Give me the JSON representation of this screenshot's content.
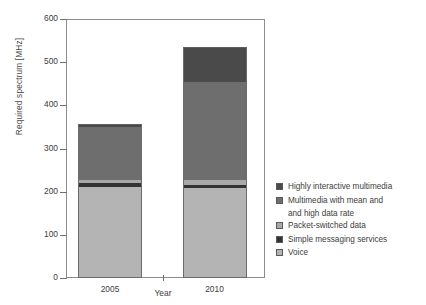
{
  "chart_data": {
    "type": "bar",
    "subtype": "stacked-bar",
    "title": "",
    "xlabel": "Year",
    "ylabel": "Required spectrum [MHz]",
    "categories": [
      "2005",
      "2010"
    ],
    "ylim": [
      0,
      600
    ],
    "yticks": [
      0,
      100,
      200,
      300,
      400,
      500,
      600
    ],
    "ytick_labels": [
      "0",
      "100",
      "200",
      "300",
      "400",
      "500",
      "600"
    ],
    "grid": false,
    "legend_position": "right",
    "series": [
      {
        "name": "Voice",
        "color": "#b4b4b4",
        "values": [
          211,
          208
        ]
      },
      {
        "name": "Simple messaging services",
        "color": "#333333",
        "values": [
          8,
          8
        ]
      },
      {
        "name": "Packet-switched data",
        "color": "#a8a8a8",
        "values": [
          9,
          10
        ]
      },
      {
        "name": "Multimedia with mean and and high data rate",
        "color": "#6e6e6e",
        "values": [
          121,
          229
        ]
      },
      {
        "name": "Highly interactive multimedia",
        "color": "#4a4a4a",
        "values": [
          8,
          80
        ]
      }
    ],
    "totals": [
      357,
      535
    ],
    "annotations": []
  },
  "legend": {
    "items": [
      {
        "label": "Highly interactive multimedia",
        "label_cont": "",
        "color": "#4a4a4a"
      },
      {
        "label": "Multimedia with mean and",
        "label_cont": "and high data rate",
        "color": "#6e6e6e"
      },
      {
        "label": "Packet-switched data",
        "label_cont": "",
        "color": "#a8a8a8"
      },
      {
        "label": "Simple messaging services",
        "label_cont": "",
        "color": "#333333"
      },
      {
        "label": "Voice",
        "label_cont": "",
        "color": "#b4b4b4"
      }
    ]
  }
}
